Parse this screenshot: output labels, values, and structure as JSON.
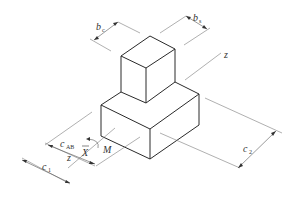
{
  "diagram": {
    "type": "isometric-technical-drawing",
    "labels": {
      "bc": {
        "main": "b",
        "sub": "c"
      },
      "bs": {
        "main": "b",
        "sub": "s"
      },
      "z_top": "z",
      "c_ab": {
        "main": "c",
        "sub": "AB"
      },
      "z_bottom": "z",
      "x_bar": "X",
      "moment": "M",
      "c1": {
        "main": "c",
        "sub": "1"
      },
      "c2": {
        "main": "c",
        "sub": "2"
      }
    },
    "colors": {
      "edge": "#2a2a2a",
      "dimension": "#555555",
      "background": "#ffffff"
    }
  }
}
